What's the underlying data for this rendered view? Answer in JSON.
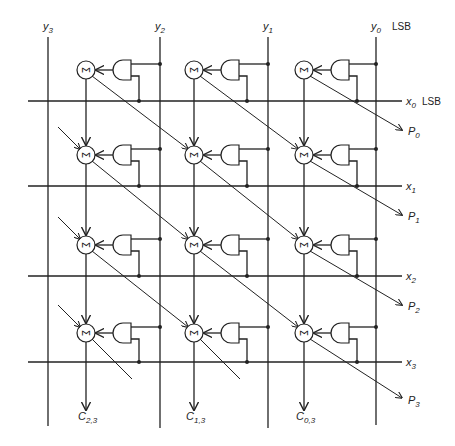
{
  "diagram": {
    "y_inputs": [
      {
        "name": "y3",
        "base": "y",
        "sub": "3",
        "x": 48
      },
      {
        "name": "y2",
        "base": "y",
        "sub": "2",
        "x": 160
      },
      {
        "name": "y1",
        "base": "y",
        "sub": "1",
        "x": 268
      },
      {
        "name": "y0",
        "base": "y",
        "sub": "0",
        "x": 376
      }
    ],
    "y_lsb_label": "LSB",
    "x_inputs": [
      {
        "name": "x0",
        "base": "x",
        "sub": "0",
        "y": 101
      },
      {
        "name": "x1",
        "base": "x",
        "sub": "1",
        "y": 186
      },
      {
        "name": "x2",
        "base": "x",
        "sub": "2",
        "y": 276
      },
      {
        "name": "x3",
        "base": "x",
        "sub": "3",
        "y": 362
      }
    ],
    "x_lsb_label": "LSB",
    "products": [
      {
        "base": "P",
        "sub": "0"
      },
      {
        "base": "P",
        "sub": "1"
      },
      {
        "base": "P",
        "sub": "2"
      },
      {
        "base": "P",
        "sub": "3"
      }
    ],
    "carries": [
      {
        "base": "C",
        "sub": "2,3"
      },
      {
        "base": "C",
        "sub": "1,3"
      },
      {
        "base": "C",
        "sub": "0,3"
      }
    ],
    "adder_symbol": "Σ",
    "cell_columns": [
      86,
      194,
      304
    ],
    "cell_rows": [
      70,
      155,
      245,
      333
    ]
  }
}
